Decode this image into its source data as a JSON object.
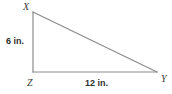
{
  "figure": {
    "kind": "right-triangle-diagram",
    "stroke_color": "#8c8c8c",
    "label_color": "#3b3b3b",
    "measure_color": "#2f2f2f",
    "background_color": "#ffffff"
  },
  "vertices": {
    "x": {
      "label": "X",
      "x": 33,
      "y": 12
    },
    "z": {
      "label": "Z",
      "x": 33,
      "y": 72
    },
    "y": {
      "label": "Y",
      "x": 157,
      "y": 72
    }
  },
  "measurements": {
    "vertical_leg": "6 in.",
    "horizontal_leg": "12 in."
  }
}
